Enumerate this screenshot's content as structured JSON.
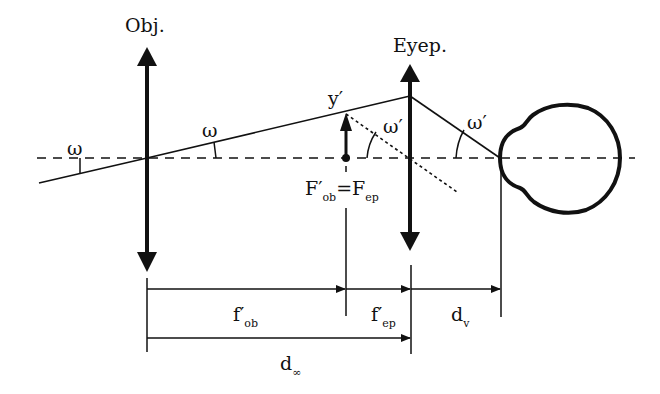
{
  "diagram": {
    "type": "telescope-optics",
    "labels": {
      "objective": "Obj.",
      "eyepiece": "Eyep.",
      "omega_left": "ω",
      "omega_mid": "ω",
      "omega_prime_inner": "ω′",
      "omega_prime_eye": "ω′",
      "image_height": "y′",
      "focal_point_main": "F′",
      "focal_point_main_sub": "ob",
      "focal_equals": "=",
      "focal_point_second": "F",
      "focal_point_second_sub": "ep",
      "f_ob_main": "f′",
      "f_ob_sub": "ob",
      "f_ep_main": "f′",
      "f_ep_sub": "ep",
      "d_v_main": "d",
      "d_v_sub": "v",
      "d_inf_main": "d",
      "d_inf_sub": "∞"
    },
    "colors": {
      "stroke": "#111111",
      "background": "#ffffff"
    }
  }
}
